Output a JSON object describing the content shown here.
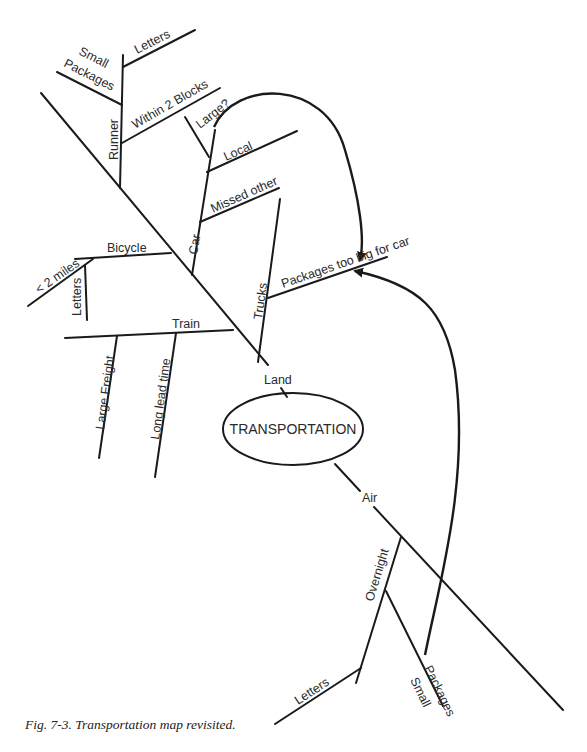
{
  "diagram": {
    "center": "TRANSPORTATION",
    "land": {
      "label": "Land",
      "runner": {
        "label": "Runner",
        "branches": [
          "Letters",
          "Small",
          "Packages",
          "Within 2 Blocks"
        ]
      },
      "car": {
        "label": "Car",
        "branches": [
          "Large?",
          "Local",
          "Missed other"
        ]
      },
      "bicycle": {
        "label": "Bicycle",
        "branches": [
          "< 2 miles",
          "Letters"
        ]
      },
      "trucks": {
        "label": "Trucks",
        "branches": [
          "Packages too  big for car"
        ]
      },
      "train": {
        "label": "Train",
        "branches": [
          "Large Freight",
          "Long lead time"
        ]
      }
    },
    "air": {
      "label": "Air",
      "overnight": {
        "label": "Overnight",
        "branches": [
          "Letters",
          "Small",
          "Packages"
        ]
      }
    }
  },
  "caption": "Fig. 7-3. Transportation map revisited."
}
